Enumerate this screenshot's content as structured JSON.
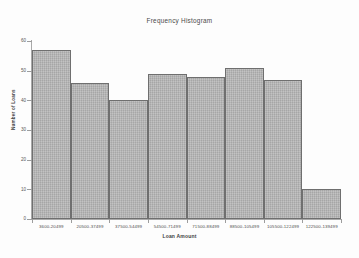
{
  "chart_data": {
    "type": "bar",
    "title": "Frequency Histogram",
    "xlabel": "Loan Amount",
    "ylabel": "Number of Loans",
    "categories": [
      "3600-20499",
      "20500-37499",
      "37500-54499",
      "54500-71499",
      "71500-88499",
      "88500-105499",
      "105500-122499",
      "122500-139499"
    ],
    "values": [
      57,
      46,
      40,
      49,
      48,
      51,
      47,
      10
    ],
    "ylim": [
      0,
      60
    ],
    "yticks": [
      0,
      10,
      20,
      30,
      40,
      50,
      60
    ],
    "ytick_labels": [
      "0",
      "10",
      "20",
      "30",
      "40",
      "50",
      "60"
    ],
    "grid": false,
    "legend": false,
    "bar_fill_color": "#b4b4b4",
    "bar_edge_color": "#6f6f6f",
    "axis_color": "#a9a9a9",
    "text_color": "#3f3f3f"
  }
}
